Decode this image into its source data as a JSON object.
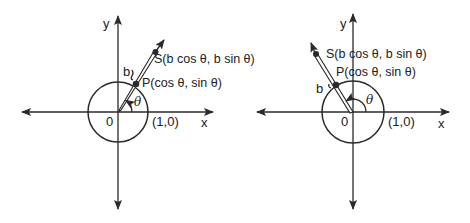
{
  "diagrams": [
    {
      "id": "left",
      "origin": [
        118,
        112
      ],
      "radius": 30,
      "angle_deg": 57,
      "labels": {
        "y_axis": "y",
        "x_axis": "x",
        "origin": "0",
        "unit_point": "(1,0)",
        "theta": "θ",
        "b": "b",
        "S": "S(b cos θ, b sin θ)",
        "P": "P(cos θ, sin θ)"
      }
    },
    {
      "id": "right",
      "origin": [
        353,
        112
      ],
      "radius": 31,
      "angle_deg": 122,
      "labels": {
        "y_axis": "y",
        "x_axis": "x",
        "origin": "0",
        "unit_point": "(1,0)",
        "theta": "θ",
        "b": "b",
        "S": "S(b cos θ, b sin θ)",
        "P": "P(cos θ, sin θ)"
      }
    }
  ],
  "colors": {
    "ink": "#2a2a2a",
    "background": "#ffffff"
  }
}
